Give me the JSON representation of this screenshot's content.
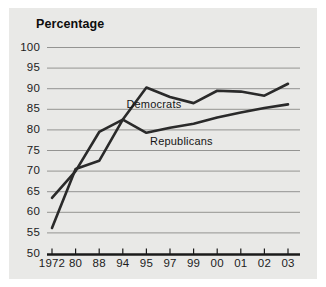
{
  "figure": {
    "title": "Percentage",
    "panel_color": "#e9e9e7",
    "page_color": "#ffffff",
    "line_color": "#2a2a2a",
    "grid_color": "#8a8a88",
    "axis_color": "#1a1a1a"
  },
  "chart_data": {
    "type": "line",
    "title": "Percentage",
    "xlabel": "",
    "ylabel": "Percentage",
    "ylim": [
      50,
      100
    ],
    "ytick_step": 5,
    "yticks": [
      100,
      95,
      90,
      85,
      80,
      75,
      70,
      65,
      60,
      55,
      50
    ],
    "grid": true,
    "grid_axis": "y",
    "legend": "inline-labels",
    "categories": [
      "1972",
      "80",
      "88",
      "94",
      "95",
      "97",
      "99",
      "00",
      "01",
      "02",
      "03"
    ],
    "series": [
      {
        "name": "Democrats",
        "label": "Democrats",
        "color": "#2a2a2a",
        "values": [
          63.5,
          70.0,
          79.5,
          82.5,
          90.3,
          88.0,
          86.5,
          89.5,
          89.3,
          88.3,
          91.2
        ]
      },
      {
        "name": "Republicans",
        "label": "Republicans",
        "color": "#2a2a2a",
        "values": [
          56.2,
          70.5,
          72.5,
          82.5,
          79.3,
          80.5,
          81.5,
          83.0,
          84.2,
          85.3,
          86.2
        ]
      }
    ],
    "annotations": [
      {
        "text": "Democrats",
        "x": "95",
        "y": 86.0
      },
      {
        "text": "Republicans",
        "x": "97",
        "y": 77.0
      }
    ]
  }
}
